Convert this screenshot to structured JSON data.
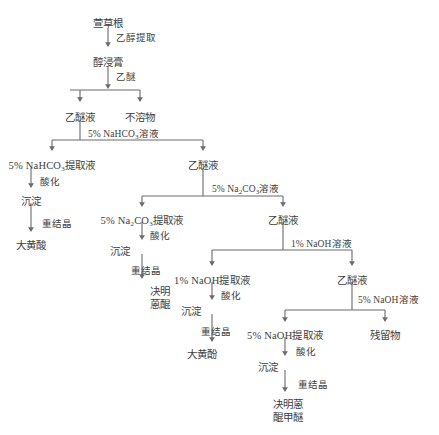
{
  "diagram": {
    "type": "flowchart",
    "title_node": "萱草根",
    "theme": {
      "line_color": "#6b6b6b",
      "text_color": "#3d3d3d",
      "background": "#ffffff"
    },
    "nodes": [
      {
        "id": "n_root",
        "label": "萱草根",
        "x": 108,
        "y": 18
      },
      {
        "id": "n_extract",
        "label": "醇浸膏",
        "x": 108,
        "y": 57
      },
      {
        "id": "n_eth1",
        "label": "乙醚液",
        "x": 80,
        "y": 112
      },
      {
        "id": "n_insol",
        "label": "不溶物",
        "x": 140,
        "y": 112
      },
      {
        "id": "n_nahco3_ex",
        "label": "5% NaHCO3提取液",
        "x": 52,
        "y": 160,
        "chem": true
      },
      {
        "id": "n_eth2",
        "label": "乙醚液",
        "x": 203,
        "y": 160
      },
      {
        "id": "n_precip1",
        "label": "沉淀",
        "x": 31,
        "y": 196
      },
      {
        "id": "n_rhein",
        "label": "大黄酸",
        "x": 31,
        "y": 240
      },
      {
        "id": "n_na2co3_ex",
        "label": "5% Na2CO3提取液",
        "x": 142,
        "y": 215,
        "chem": true
      },
      {
        "id": "n_eth3",
        "label": "乙醚液",
        "x": 283,
        "y": 215
      },
      {
        "id": "n_precip2",
        "label": "沉淀",
        "x": 120,
        "y": 246
      },
      {
        "id": "n_chryso1",
        "label": "决明",
        "label2": "蒽醌",
        "x": 160,
        "y": 286
      },
      {
        "id": "n_naoh1_ex",
        "label": "1% NaOH提取液",
        "x": 212,
        "y": 275,
        "chem": true
      },
      {
        "id": "n_eth4",
        "label": "乙醚液",
        "x": 352,
        "y": 275
      },
      {
        "id": "n_precip3",
        "label": "沉淀",
        "x": 191,
        "y": 306
      },
      {
        "id": "n_chrysophanol",
        "label": "大黄酚",
        "x": 202,
        "y": 349
      },
      {
        "id": "n_naoh5_ex",
        "label": "5% NaOH提取液",
        "x": 285,
        "y": 330,
        "chem": true
      },
      {
        "id": "n_residue",
        "label": "残留物",
        "x": 385,
        "y": 330
      },
      {
        "id": "n_precip4",
        "label": "沉淀",
        "x": 268,
        "y": 362
      },
      {
        "id": "n_final",
        "label": "决明蒽",
        "label2": "醌甲醚",
        "x": 288,
        "y": 399
      }
    ],
    "edge_labels": [
      {
        "id": "el_ethanol",
        "text": "乙醇提取",
        "x": 116,
        "y": 33
      },
      {
        "id": "el_ether",
        "text": "乙醚",
        "x": 116,
        "y": 72
      },
      {
        "id": "el_nahco3",
        "text": "5% NaHCO3溶液",
        "x": 88,
        "y": 129,
        "chem": true
      },
      {
        "id": "el_acid1",
        "text": "酸化",
        "x": 40,
        "y": 177
      },
      {
        "id": "el_recryst1",
        "text": "重结晶",
        "x": 42,
        "y": 219
      },
      {
        "id": "el_na2co3",
        "text": "5% Na2CO3溶液",
        "x": 212,
        "y": 184,
        "chem": true
      },
      {
        "id": "el_acid2",
        "text": "酸化",
        "x": 150,
        "y": 231
      },
      {
        "id": "el_recryst2",
        "text": "重结晶",
        "x": 131,
        "y": 266
      },
      {
        "id": "el_naoh1",
        "text": "1% NaOH溶液",
        "x": 291,
        "y": 239,
        "chem": true
      },
      {
        "id": "el_acid3",
        "text": "酸化",
        "x": 221,
        "y": 291
      },
      {
        "id": "el_recryst3",
        "text": "重结晶",
        "x": 201,
        "y": 327
      },
      {
        "id": "el_naoh5",
        "text": "5% NaOH溶液",
        "x": 358,
        "y": 295,
        "chem": true
      },
      {
        "id": "el_acid4",
        "text": "酸化",
        "x": 296,
        "y": 347
      },
      {
        "id": "el_recryst4",
        "text": "重结晶",
        "x": 298,
        "y": 380
      }
    ]
  }
}
